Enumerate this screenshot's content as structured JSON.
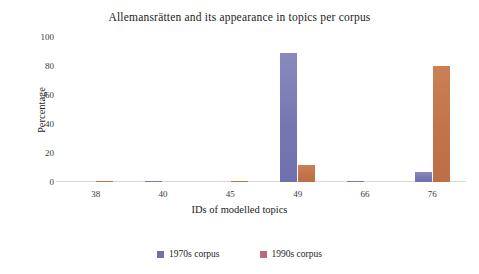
{
  "chart_data": {
    "type": "bar",
    "title": "Allemansrätten and its appearance in topics per corpus",
    "xlabel": "IDs of modelled topics",
    "ylabel": "Percentage",
    "categories": [
      "38",
      "40",
      "45",
      "49",
      "66",
      "76"
    ],
    "series": [
      {
        "name": "1970s corpus",
        "color": "#6f70ad",
        "values": [
          0,
          0.4,
          0,
          89,
          0.2,
          7
        ]
      },
      {
        "name": "1990s corpus",
        "color": "#c3734a",
        "values": [
          1,
          0,
          1,
          12,
          0,
          80
        ]
      }
    ],
    "ylim": [
      0,
      100
    ],
    "yticks": [
      "0",
      "20",
      "40",
      "60",
      "80",
      "100"
    ],
    "grid": false,
    "legend_position": "bottom"
  }
}
